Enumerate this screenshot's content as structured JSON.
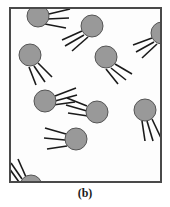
{
  "figure": {
    "caption": "(b)",
    "panel_label": "b",
    "canvas": {
      "width": 170,
      "height": 207
    },
    "frame": {
      "x": 9,
      "y": 7,
      "width": 153,
      "height": 176,
      "stroke_color": "#4a4a4a",
      "stroke_width": 2,
      "fill_color": "#fdfdfd"
    },
    "style": {
      "particle_fill": "#999999",
      "particle_stroke": "#555555",
      "particle_stroke_width": 1,
      "tail_color": "#1a1a1a",
      "tail_width": 1.6,
      "background": "#ffffff",
      "caption_color": "#1a1a1a"
    },
    "particle_count": 10,
    "tails_per_particle": "3-4",
    "particles": [
      {
        "id": "particle-1",
        "cx": 38,
        "cy": 16,
        "r": 11,
        "angle_deg": 25,
        "tails": [
          {
            "x1": 49,
            "y1": 14,
            "x2": 70,
            "y2": 9
          },
          {
            "x1": 47,
            "y1": 19,
            "x2": 69,
            "y2": 18
          },
          {
            "x1": 45,
            "y1": 24,
            "x2": 66,
            "y2": 28
          }
        ]
      },
      {
        "id": "particle-2",
        "cx": 92,
        "cy": 26,
        "r": 11,
        "angle_deg": 205,
        "tails": [
          {
            "x1": 82,
            "y1": 31,
            "x2": 62,
            "y2": 40
          },
          {
            "x1": 84,
            "y1": 35,
            "x2": 65,
            "y2": 46
          },
          {
            "x1": 88,
            "y1": 37,
            "x2": 72,
            "y2": 51
          }
        ]
      },
      {
        "id": "particle-3",
        "cx": 162,
        "cy": 33,
        "r": 11,
        "angle_deg": 200,
        "clipped_edge": "right",
        "tails": [
          {
            "x1": 152,
            "y1": 38,
            "x2": 133,
            "y2": 45
          },
          {
            "x1": 154,
            "y1": 42,
            "x2": 136,
            "y2": 52
          },
          {
            "x1": 157,
            "y1": 44,
            "x2": 142,
            "y2": 58
          }
        ]
      },
      {
        "id": "particle-4",
        "cx": 30,
        "cy": 55,
        "r": 11,
        "angle_deg": 55,
        "tails": [
          {
            "x1": 38,
            "y1": 63,
            "x2": 52,
            "y2": 77
          },
          {
            "x1": 34,
            "y1": 66,
            "x2": 45,
            "y2": 82
          },
          {
            "x1": 29,
            "y1": 67,
            "x2": 36,
            "y2": 85
          }
        ]
      },
      {
        "id": "particle-5",
        "cx": 106,
        "cy": 57,
        "r": 11,
        "angle_deg": 50,
        "tails": [
          {
            "x1": 115,
            "y1": 64,
            "x2": 132,
            "y2": 74
          },
          {
            "x1": 111,
            "y1": 68,
            "x2": 126,
            "y2": 80
          },
          {
            "x1": 106,
            "y1": 69,
            "x2": 118,
            "y2": 84
          }
        ]
      },
      {
        "id": "particle-6",
        "cx": 45,
        "cy": 101,
        "r": 11,
        "angle_deg": 330,
        "tails": [
          {
            "x1": 55,
            "y1": 96,
            "x2": 76,
            "y2": 88
          },
          {
            "x1": 55,
            "y1": 101,
            "x2": 77,
            "y2": 95
          },
          {
            "x1": 53,
            "y1": 105,
            "x2": 75,
            "y2": 102
          }
        ]
      },
      {
        "id": "particle-7",
        "cx": 97,
        "cy": 112,
        "r": 11,
        "angle_deg": 205,
        "tails": [
          {
            "x1": 87,
            "y1": 106,
            "x2": 67,
            "y2": 98
          },
          {
            "x1": 87,
            "y1": 111,
            "x2": 66,
            "y2": 105
          },
          {
            "x1": 88,
            "y1": 116,
            "x2": 68,
            "y2": 113
          }
        ]
      },
      {
        "id": "particle-8",
        "cx": 145,
        "cy": 110,
        "r": 11,
        "angle_deg": 60,
        "tails": [
          {
            "x1": 152,
            "y1": 119,
            "x2": 161,
            "y2": 138
          },
          {
            "x1": 147,
            "y1": 121,
            "x2": 153,
            "y2": 141
          },
          {
            "x1": 142,
            "y1": 121,
            "x2": 145,
            "y2": 141
          }
        ]
      },
      {
        "id": "particle-9",
        "cx": 76,
        "cy": 139,
        "r": 11,
        "angle_deg": 195,
        "tails": [
          {
            "x1": 66,
            "y1": 134,
            "x2": 45,
            "y2": 128
          },
          {
            "x1": 65,
            "y1": 140,
            "x2": 44,
            "y2": 138
          },
          {
            "x1": 67,
            "y1": 146,
            "x2": 47,
            "y2": 149
          }
        ]
      },
      {
        "id": "particle-10",
        "cx": 31,
        "cy": 186,
        "r": 11,
        "angle_deg": 300,
        "clipped_edge": "bottom",
        "tails": [
          {
            "x1": 26,
            "y1": 177,
            "x2": 18,
            "y2": 159
          },
          {
            "x1": 22,
            "y1": 179,
            "x2": 11,
            "y2": 163
          },
          {
            "x1": 19,
            "y1": 182,
            "x2": 9,
            "y2": 168
          }
        ]
      }
    ]
  }
}
